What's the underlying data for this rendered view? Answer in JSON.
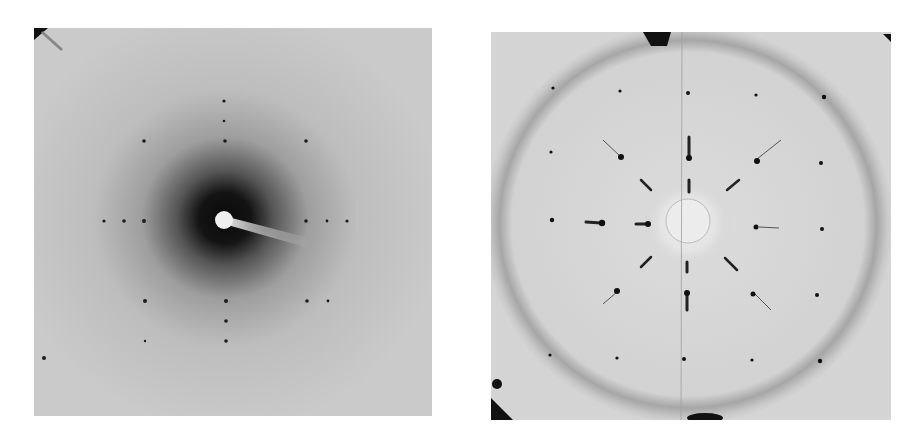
{
  "figure": {
    "panels": [
      {
        "id": "left",
        "description": "X-ray diffraction pattern with diffuse dark halo around beam stop and sparse lattice spots",
        "background": "#c9c9c9",
        "halo_color": "#1a1a1a"
      },
      {
        "id": "right",
        "description": "X-ray diffraction pattern with powder ring and radially streaked lattice spots (12-fold symmetry)",
        "background": "#d6d6d6",
        "ring_color": "#9a9a9a",
        "spot_color": "#111111"
      }
    ]
  }
}
